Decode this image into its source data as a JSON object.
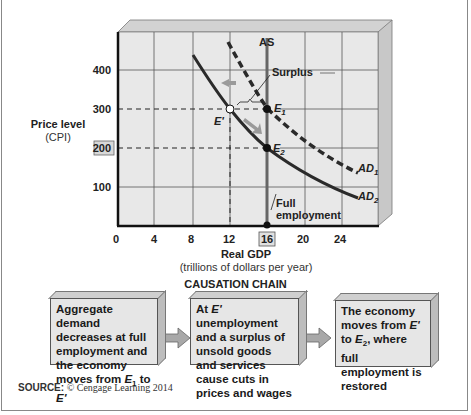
{
  "chart_data": {
    "type": "line",
    "title": "",
    "xlabel": "Real GDP",
    "xlabel_sub": "(trillions of dollars per year)",
    "ylabel": "Price level",
    "ylabel_sub": "(CPI)",
    "x_ticks": [
      "0",
      "4",
      "8",
      "12",
      "16",
      "20",
      "24"
    ],
    "y_ticks": [
      "100",
      "200",
      "300",
      "400"
    ],
    "xlim": [
      0,
      24
    ],
    "ylim": [
      0,
      450
    ],
    "grid": true,
    "highlighted_ticks": {
      "x": "16",
      "y": "200"
    },
    "series": [
      {
        "name": "AD1",
        "style": "dashed",
        "points": [
          [
            12.3,
            420
          ],
          [
            16,
            300
          ],
          [
            24,
            140
          ]
        ]
      },
      {
        "name": "AD2",
        "style": "solid",
        "points": [
          [
            8.2,
            435
          ],
          [
            12,
            290
          ],
          [
            16,
            200
          ],
          [
            24,
            115
          ]
        ]
      },
      {
        "name": "AS",
        "style": "vertical",
        "x": 16
      }
    ],
    "points": [
      {
        "label": "E1",
        "x": 16,
        "y": 300,
        "fill": "black"
      },
      {
        "label": "E'",
        "x": 12,
        "y": 300,
        "fill": "white"
      },
      {
        "label": "E2",
        "x": 16,
        "y": 200,
        "fill": "black"
      },
      {
        "label": "Full employment",
        "x": 16,
        "y": 0,
        "fill": "black"
      }
    ],
    "annotations": [
      "AS",
      "Surplus",
      "Full employment",
      "AD1",
      "AD2",
      "E1",
      "E'",
      "E2"
    ]
  },
  "axis": {
    "y_title": "Price level",
    "y_sub": "(CPI)",
    "x_title": "Real GDP",
    "x_sub": "(trillions of dollars per year)",
    "x_ticks": [
      "0",
      "4",
      "8",
      "12",
      "16",
      "20",
      "24"
    ],
    "y_ticks": [
      "400",
      "300",
      "200",
      "100"
    ]
  },
  "labels": {
    "as": "AS",
    "surplus": "Surplus",
    "e1": "E",
    "e1_sub": "1",
    "e_prime": "E'",
    "e2": "E",
    "e2_sub": "2",
    "ad1": "AD",
    "ad1_sub": "1",
    "ad2": "AD",
    "ad2_sub": "2",
    "full1": "Full",
    "full2": "employment"
  },
  "causation": {
    "title": "CAUSATION CHAIN",
    "boxes": [
      {
        "text_html": "Aggregate demand decreases at full employment and the economy moves from <i>E</i><sub>1</sub> to <i>E'</i>"
      },
      {
        "text_html": "At <i>E'</i> unemployment and a surplus of unsold goods and services cause cuts in prices and wages"
      },
      {
        "text_html": "The economy moves from <i>E'</i> to <i>E</i><sub>2</sub>, where full employment is restored"
      }
    ]
  },
  "source": {
    "label": "SOURCE:",
    "text": "© Cengage Learning 2014"
  },
  "colors": {
    "plot_bg": "#e8e8e8",
    "grid": "#555555",
    "curve": "#2a2a2a",
    "as_line": "#666666",
    "arrow": "#9a9a9a",
    "box_bg": "#e6e6e6"
  }
}
